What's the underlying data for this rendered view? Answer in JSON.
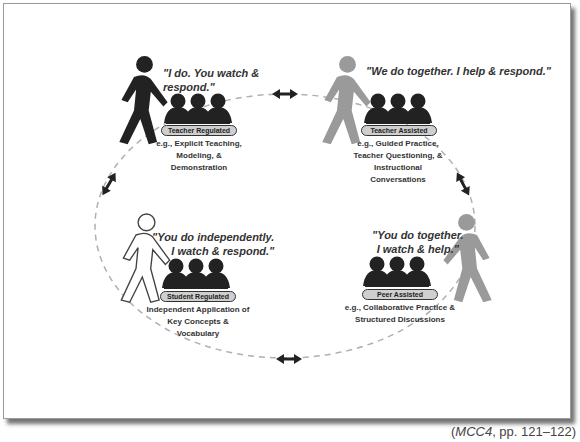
{
  "diagram": {
    "quadrants": [
      {
        "id": "teacher-regulated",
        "quote": "\"I do. You watch & respond.\"",
        "quote_line1": "\"I do. You watch &",
        "quote_line2": "respond.\"",
        "label": "Teacher Regulated",
        "desc_line1": "e.g., Explicit Teaching,",
        "desc_line2": "Modeling, &",
        "desc_line3": "Demonstration",
        "teacher_color": "#222222"
      },
      {
        "id": "teacher-assisted",
        "quote": "\"We do together. I help & respond.\"",
        "label": "Teacher Assisted",
        "desc_line1": "e.g., Guided Practice,",
        "desc_line2": "Teacher Questioning, &",
        "desc_line3": "Instructional Conversations",
        "teacher_color": "#9a9a9a"
      },
      {
        "id": "peer-assisted",
        "quote_line1": "\"You do together.",
        "quote_line2": "I watch & help.\"",
        "label": "Peer Assisted",
        "desc_line1": "e.g., Collaborative Practice &",
        "desc_line2": "Structured Discussions",
        "teacher_color": "#9a9a9a"
      },
      {
        "id": "student-regulated",
        "quote_line1": "\"You do independently.",
        "quote_line2": "I watch & respond.\"",
        "label": "Student Regulated",
        "desc_line1": "Independent Application of",
        "desc_line2": "Key Concepts & Vocabulary",
        "teacher_color": "#ffffff"
      }
    ],
    "cycle": {
      "style": "dashed-ellipse",
      "arrows": "bidirectional",
      "arrow_count": 4
    },
    "colors": {
      "student_group": "#222222",
      "pill_fill": "#cfcfcf",
      "dash": "#b0b0b0"
    }
  },
  "caption": {
    "source": "MCC4",
    "pages": ", pp. 121–122)",
    "open": "("
  }
}
